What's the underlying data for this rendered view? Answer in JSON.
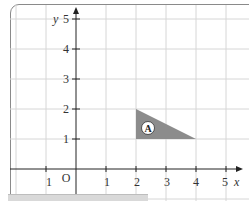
{
  "diagram": {
    "type": "coordinate-grid",
    "axes": {
      "x_label": "x",
      "y_label": "y",
      "origin_label": "O",
      "x_ticks": [
        {
          "value": -1,
          "label": "1"
        },
        {
          "value": 1,
          "label": "1"
        },
        {
          "value": 2,
          "label": "2"
        },
        {
          "value": 3,
          "label": "3"
        },
        {
          "value": 4,
          "label": "4"
        },
        {
          "value": 5,
          "label": "5"
        }
      ],
      "y_ticks": [
        {
          "value": 1,
          "label": "1"
        },
        {
          "value": 2,
          "label": "2"
        },
        {
          "value": 3,
          "label": "3"
        },
        {
          "value": 4,
          "label": "4"
        },
        {
          "value": 5,
          "label": "5"
        }
      ]
    },
    "shapes": [
      {
        "name": "A",
        "label": "A",
        "type": "triangle",
        "vertices": [
          [
            2,
            2
          ],
          [
            2,
            1
          ],
          [
            4,
            1
          ]
        ],
        "fill": "#8c8c8c"
      }
    ],
    "colors": {
      "grid": "#d6d6d6",
      "axis": "#222222",
      "frame": "#8a8a8a",
      "shape_fill": "#8c8c8c"
    }
  }
}
